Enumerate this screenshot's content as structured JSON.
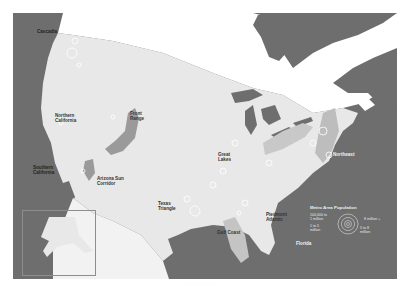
{
  "map": {
    "title": "Megaregions of the United States",
    "regions": [
      {
        "name": "Cascadia"
      },
      {
        "name": "Northern\nCalifornia"
      },
      {
        "name": "Southern\nCalifornia"
      },
      {
        "name": "Arizona Sun\nCorridor"
      },
      {
        "name": "Front\nRange"
      },
      {
        "name": "Texas\nTriangle"
      },
      {
        "name": "Gulf Coast"
      },
      {
        "name": "Great\nLakes"
      },
      {
        "name": "Piedmont\nAtlantic"
      },
      {
        "name": "Northeast"
      },
      {
        "name": "Florida"
      }
    ],
    "inset": {
      "name": "Alaska"
    },
    "legend": {
      "title": "Metro Area Population",
      "items": [
        {
          "label": "100,000 to\n1 million"
        },
        {
          "label": "1 to 5\nmillion"
        },
        {
          "label": "5 to 8\nmillion"
        },
        {
          "label": "8 million +"
        }
      ]
    },
    "colors": {
      "water": "#6e6e6e",
      "land": "#e8e8e8",
      "megaregion": "#8a8a8a",
      "canada": "#ffffff"
    }
  },
  "caption": "· · · · · · · · · ·"
}
